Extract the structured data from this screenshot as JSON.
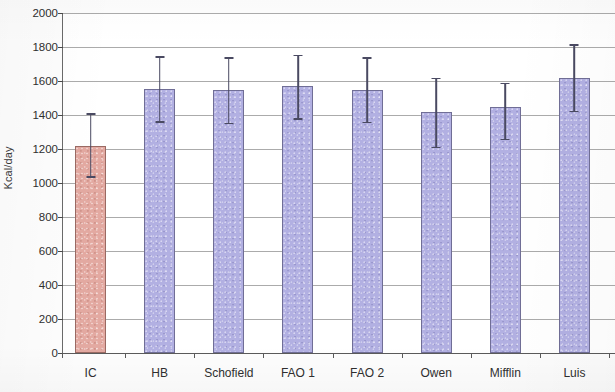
{
  "chart_data": {
    "type": "bar",
    "title": "",
    "subtitle": "",
    "xlabel": "",
    "ylabel": "Kcal/day",
    "categories": [
      "IC",
      "HB",
      "Schofield",
      "FAO 1",
      "FAO 2",
      "Owen",
      "Mifflin",
      "Luis"
    ],
    "values": [
      1220,
      1555,
      1545,
      1570,
      1545,
      1415,
      1450,
      1620
    ],
    "error_upper": [
      1410,
      1745,
      1740,
      1755,
      1740,
      1620,
      1590,
      1815
    ],
    "error_lower": [
      1030,
      1355,
      1345,
      1370,
      1350,
      1205,
      1250,
      1415
    ],
    "series": [
      {
        "name": "Energy expenditure",
        "values": [
          1220,
          1555,
          1545,
          1570,
          1545,
          1415,
          1450,
          1620
        ]
      }
    ],
    "ylim": [
      0,
      2000
    ],
    "ytick_values": [
      0,
      200,
      400,
      600,
      800,
      1000,
      1200,
      1400,
      1600,
      1800,
      2000
    ],
    "ytick_labels": [
      "0",
      "200",
      "400",
      "600",
      "800",
      "1000",
      "1200",
      "1400",
      "1600",
      "1800",
      "2000"
    ],
    "grid": true,
    "grid_axis": "y",
    "legend": false,
    "legend_position": "none",
    "error_bars": true,
    "bar_colors": {
      "highlight": "#e3a9a1",
      "default": "#b2b0e2",
      "highlight_category": "IC"
    },
    "colors": {
      "background": "#ffffff",
      "gridline": "#8f8f8f",
      "axis": "#5a5a5a",
      "error_bar": "#4a4a62",
      "text": "#2f2f2f"
    }
  }
}
